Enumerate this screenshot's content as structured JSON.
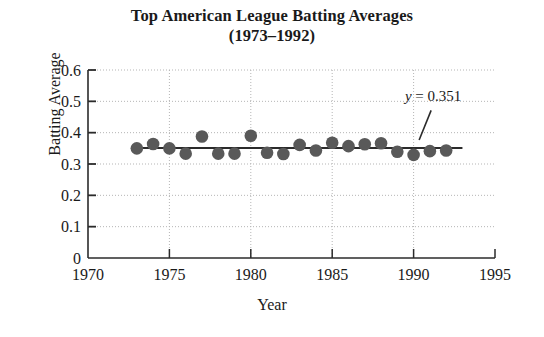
{
  "chart_data": {
    "type": "scatter",
    "title": "Top American League Batting Averages",
    "subtitle": "(1973–1992)",
    "xlabel": "Year",
    "ylabel": "Batting Average",
    "xlim": [
      1970,
      1995
    ],
    "ylim": [
      0,
      0.6
    ],
    "xticks": [
      "1970",
      "1975",
      "1980",
      "1985",
      "1990",
      "1995"
    ],
    "xtick_values": [
      1970,
      1975,
      1980,
      1985,
      1990,
      1995
    ],
    "yticks": [
      "0",
      "0.1",
      "0.2",
      "0.3",
      "0.4",
      "0.5",
      "0.6"
    ],
    "ytick_values": [
      0,
      0.1,
      0.2,
      0.3,
      0.4,
      0.5,
      0.6
    ],
    "grid": true,
    "legend": null,
    "x": [
      1973,
      1974,
      1975,
      1976,
      1977,
      1978,
      1979,
      1980,
      1981,
      1982,
      1983,
      1984,
      1985,
      1986,
      1987,
      1988,
      1989,
      1990,
      1991,
      1992
    ],
    "values": [
      0.35,
      0.364,
      0.35,
      0.333,
      0.388,
      0.333,
      0.333,
      0.39,
      0.336,
      0.332,
      0.361,
      0.343,
      0.368,
      0.357,
      0.363,
      0.366,
      0.339,
      0.329,
      0.341,
      0.343
    ],
    "series": [
      {
        "name": "Top American League batting average",
        "marker": "circle",
        "color": "#595959",
        "values": [
          0.35,
          0.364,
          0.35,
          0.333,
          0.388,
          0.333,
          0.333,
          0.39,
          0.336,
          0.332,
          0.361,
          0.343,
          0.368,
          0.357,
          0.363,
          0.366,
          0.339,
          0.329,
          0.341,
          0.343
        ]
      }
    ],
    "fit_line": {
      "type": "horizontal",
      "y": 0.351,
      "label": "y = 0.351",
      "label_variable": "y",
      "label_rest": "= 0.351",
      "x_start": 1973,
      "x_end": 1993,
      "color": "#2b2b2b"
    },
    "annotations": [
      {
        "text": "y = 0.351",
        "x": 1991.2,
        "y": 0.5,
        "leader_line": true
      }
    ],
    "colors": {
      "marker": "#595959",
      "line": "#2b2b2b",
      "axis": "#2b2b2b",
      "grid": "#b5b5b5",
      "text": "#1a1a1a",
      "background": "#ffffff"
    }
  }
}
